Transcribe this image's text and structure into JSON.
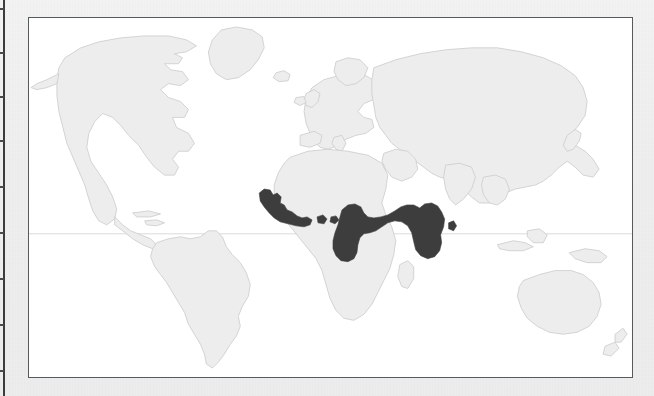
{
  "figure": {
    "type": "distribution-map",
    "projection": "world-equirectangular-like",
    "frame_border_color": "#555a5c",
    "page_background_color": "#efefef",
    "ocean_color": "#ffffff",
    "land_color": "#ededed",
    "land_outline_color": "#cfcfcf",
    "range_shading_color": "#3d3d3d",
    "equator_line_color": "#d6d6d6",
    "caption": "",
    "title": "",
    "legend": []
  },
  "map": {
    "equator_label": "Equator",
    "shaded_range_description": "West and Central Africa",
    "shaded_regions": [
      {
        "name": "Upper Guinea forest block",
        "countries": "Guinea, Sierra Leone, Liberia, Ivory Coast"
      },
      {
        "name": "Ghana-Togo relict patches",
        "countries": "Ghana, Togo"
      },
      {
        "name": "Lower Guinea / Congo Basin block",
        "countries": "Nigeria, Cameroon, Equatorial Guinea, Gabon, Congo, DR Congo, Central African Republic, Uganda"
      }
    ],
    "landmasses": [
      "North America",
      "South America",
      "Greenland",
      "Europe",
      "Africa",
      "Asia",
      "Australia",
      "New Zealand",
      "Indonesia",
      "Japan",
      "British Isles",
      "Madagascar",
      "Iceland"
    ]
  },
  "scan_artifacts": {
    "spine_line_color": "#3b3b3b",
    "spine_tick_color": "#4a4a4a",
    "spine_tick_count": 9
  }
}
